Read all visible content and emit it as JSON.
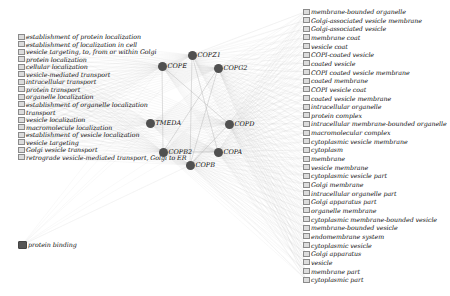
{
  "diagram": {
    "type": "gene-term network",
    "colors": {
      "term_box_fill": "#dcdcdc",
      "term_box_border": "#8a8a8a",
      "gene_node": "#505050",
      "edge": "#b0b0b0",
      "background": "#ffffff"
    },
    "left_terms": [
      {
        "label": "establishment of protein localization"
      },
      {
        "label": "establishment of localization in cell"
      },
      {
        "label": "vesicle targeting, to, from or within Golgi"
      },
      {
        "label": "protein localization"
      },
      {
        "label": "cellular localization"
      },
      {
        "label": "vesicle-mediated transport"
      },
      {
        "label": "intracellular transport"
      },
      {
        "label": "protein transport"
      },
      {
        "label": "organelle localization"
      },
      {
        "label": "establishment of organelle localization"
      },
      {
        "label": "transport"
      },
      {
        "label": "vesicle localization"
      },
      {
        "label": "macromolecule localization"
      },
      {
        "label": "establishment of vesicle localization"
      },
      {
        "label": "vesicle targeting"
      },
      {
        "label": "Golgi vesicle transport"
      },
      {
        "label": "retrograde vesicle-mediated transport, Golgi to ER"
      }
    ],
    "function_term": {
      "label": "protein binding"
    },
    "genes": [
      {
        "label": "COPZ1",
        "x": 192,
        "y": 55
      },
      {
        "label": "COPE",
        "x": 162,
        "y": 66
      },
      {
        "label": "COPG2",
        "x": 218,
        "y": 68
      },
      {
        "label": "TMEDA",
        "x": 150,
        "y": 123
      },
      {
        "label": "COPD",
        "x": 229,
        "y": 124
      },
      {
        "label": "COPB2",
        "x": 163,
        "y": 152
      },
      {
        "label": "COPA",
        "x": 218,
        "y": 152
      },
      {
        "label": "COPB",
        "x": 190,
        "y": 165
      }
    ],
    "right_terms": [
      {
        "label": "membrane-bounded organelle"
      },
      {
        "label": "Golgi-associated vesicle membrane"
      },
      {
        "label": "Golgi-associated vesicle"
      },
      {
        "label": "membrane coat"
      },
      {
        "label": "vesicle coat"
      },
      {
        "label": "COPI-coated vesicle"
      },
      {
        "label": "coated vesicle"
      },
      {
        "label": "COPI coated vesicle membrane"
      },
      {
        "label": "coated membrane"
      },
      {
        "label": "COPI vesicle coat"
      },
      {
        "label": "coated vesicle membrane"
      },
      {
        "label": "intracellular organelle"
      },
      {
        "label": "protein complex"
      },
      {
        "label": "intracellular membrane-bounded organelle"
      },
      {
        "label": "macromolecular complex"
      },
      {
        "label": "cytoplasmic vesicle membrane"
      },
      {
        "label": "cytoplasm"
      },
      {
        "label": "membrane"
      },
      {
        "label": "vesicle membrane"
      },
      {
        "label": "cytoplasmic vesicle part"
      },
      {
        "label": "Golgi membrane"
      },
      {
        "label": "intracellular organelle part"
      },
      {
        "label": "Golgi apparatus part"
      },
      {
        "label": "organelle membrane"
      },
      {
        "label": "cytoplasmic membrane-bounded vesicle"
      },
      {
        "label": "membrane-bounded vesicle"
      },
      {
        "label": "endomembrane system"
      },
      {
        "label": "cytoplasmic vesicle"
      },
      {
        "label": "Golgi apparatus"
      },
      {
        "label": "vesicle"
      },
      {
        "label": "membrane part"
      },
      {
        "label": "cytoplasmic part"
      }
    ]
  }
}
